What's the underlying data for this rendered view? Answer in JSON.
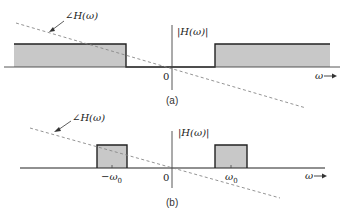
{
  "panels": [
    {
      "id": "a",
      "caption": "(a)",
      "filter_type": "highpass (ideal, magnitude)",
      "magnitude_label": "|H(ω)|",
      "phase_label": "∠H(ω)",
      "origin_label": "0",
      "axis_label": "ω",
      "axis_arrow": "→"
    },
    {
      "id": "b",
      "caption": "(b)",
      "filter_type": "bandpass (ideal, magnitude)",
      "magnitude_label": "|H(ω)|",
      "phase_label": "∠H(ω)",
      "origin_label": "0",
      "neg_center_label": "−ω",
      "neg_center_sub": "0",
      "pos_center_label": "ω",
      "pos_center_sub": "0",
      "axis_label": "ω",
      "axis_arrow": "→"
    }
  ],
  "colors": {
    "fill": "#c8c8c8",
    "line": "#222222",
    "dashed": "#888888"
  }
}
